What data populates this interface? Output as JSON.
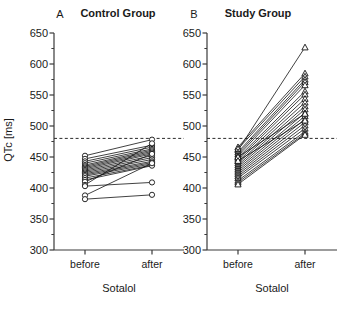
{
  "figure": {
    "ylabel": "QTc [ms]",
    "xlabel": "Sotalol",
    "y_ticks": [
      300,
      350,
      400,
      450,
      500,
      550,
      600,
      650
    ],
    "x_categories": [
      "before",
      "after"
    ],
    "reference_line_value": 480
  },
  "panels": [
    {
      "letter": "A",
      "title": "Control Group",
      "xlabel": "Sotalol"
    },
    {
      "letter": "B",
      "title": "Study Group",
      "xlabel": "Sotalol"
    }
  ],
  "chart_data": [
    {
      "type": "line",
      "title": "Control Group",
      "panel_letter": "A",
      "xlabel": "Sotalol",
      "ylabel": "QTc [ms]",
      "categories": [
        "before",
        "after"
      ],
      "ylim": [
        300,
        650
      ],
      "y_ticks": [
        300,
        350,
        400,
        450,
        500,
        550,
        600,
        650
      ],
      "minor_tick_step": 25,
      "grid": false,
      "legend": "none",
      "marker": "circle",
      "reference_line": 480,
      "annotations": [
        "dashed reference line at 480 ms"
      ],
      "series": [
        {
          "name": "subject-1",
          "values": [
            452,
            478
          ]
        },
        {
          "name": "subject-2",
          "values": [
            447,
            469
          ]
        },
        {
          "name": "subject-3",
          "values": [
            443,
            466
          ]
        },
        {
          "name": "subject-4",
          "values": [
            440,
            463
          ]
        },
        {
          "name": "subject-5",
          "values": [
            437,
            461
          ]
        },
        {
          "name": "subject-6",
          "values": [
            435,
            459
          ]
        },
        {
          "name": "subject-7",
          "values": [
            433,
            457
          ]
        },
        {
          "name": "subject-8",
          "values": [
            431,
            455
          ]
        },
        {
          "name": "subject-9",
          "values": [
            429,
            452
          ]
        },
        {
          "name": "subject-10",
          "values": [
            427,
            449
          ]
        },
        {
          "name": "subject-11",
          "values": [
            425,
            446
          ]
        },
        {
          "name": "subject-12",
          "values": [
            423,
            443
          ]
        },
        {
          "name": "subject-13",
          "values": [
            421,
            441
          ]
        },
        {
          "name": "subject-14",
          "values": [
            419,
            439
          ]
        },
        {
          "name": "subject-15",
          "values": [
            416,
            437
          ]
        },
        {
          "name": "subject-16",
          "values": [
            413,
            436
          ]
        },
        {
          "name": "subject-17",
          "values": [
            410,
            455
          ]
        },
        {
          "name": "subject-18",
          "values": [
            405,
            472
          ]
        },
        {
          "name": "subject-19",
          "values": [
            403,
            409
          ]
        },
        {
          "name": "subject-20",
          "values": [
            388,
            440
          ]
        },
        {
          "name": "subject-21",
          "values": [
            382,
            389
          ]
        }
      ]
    },
    {
      "type": "line",
      "title": "Study Group",
      "panel_letter": "B",
      "xlabel": "Sotalol",
      "ylabel": "QTc [ms]",
      "categories": [
        "before",
        "after"
      ],
      "ylim": [
        300,
        650
      ],
      "y_ticks": [
        300,
        350,
        400,
        450,
        500,
        550,
        600,
        650
      ],
      "minor_tick_step": 25,
      "grid": false,
      "legend": "none",
      "marker": "triangle",
      "reference_line": 480,
      "annotations": [
        "dashed reference line at 480 ms",
        "one outlier reaching 627 ms"
      ],
      "series": [
        {
          "name": "subject-1",
          "values": [
            461,
            627
          ]
        },
        {
          "name": "subject-2",
          "values": [
            466,
            585
          ]
        },
        {
          "name": "subject-3",
          "values": [
            463,
            580
          ]
        },
        {
          "name": "subject-4",
          "values": [
            458,
            575
          ]
        },
        {
          "name": "subject-5",
          "values": [
            455,
            571
          ]
        },
        {
          "name": "subject-6",
          "values": [
            452,
            566
          ]
        },
        {
          "name": "subject-7",
          "values": [
            449,
            556
          ]
        },
        {
          "name": "subject-8",
          "values": [
            446,
            551
          ]
        },
        {
          "name": "subject-9",
          "values": [
            443,
            544
          ]
        },
        {
          "name": "subject-10",
          "values": [
            440,
            538
          ]
        },
        {
          "name": "subject-11",
          "values": [
            437,
            532
          ]
        },
        {
          "name": "subject-12",
          "values": [
            434,
            527
          ]
        },
        {
          "name": "subject-13",
          "values": [
            431,
            521
          ]
        },
        {
          "name": "subject-14",
          "values": [
            428,
            516
          ]
        },
        {
          "name": "subject-15",
          "values": [
            425,
            511
          ]
        },
        {
          "name": "subject-16",
          "values": [
            422,
            506
          ]
        },
        {
          "name": "subject-17",
          "values": [
            419,
            501
          ]
        },
        {
          "name": "subject-18",
          "values": [
            416,
            496
          ]
        },
        {
          "name": "subject-19",
          "values": [
            412,
            491
          ]
        },
        {
          "name": "subject-20",
          "values": [
            409,
            488
          ]
        },
        {
          "name": "subject-21",
          "values": [
            406,
            486
          ]
        },
        {
          "name": "subject-22",
          "values": [
            450,
            520
          ]
        },
        {
          "name": "subject-23",
          "values": [
            444,
            509
          ]
        }
      ]
    }
  ]
}
